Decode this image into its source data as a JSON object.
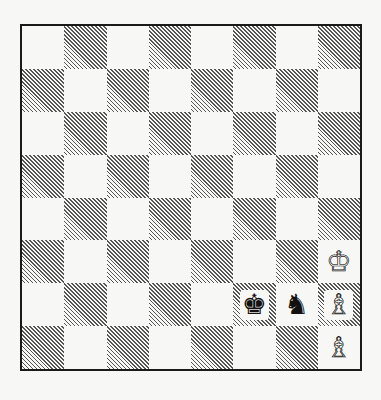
{
  "diagram": {
    "type": "chess-position",
    "orientation": "white-bottom",
    "files": [
      "a",
      "b",
      "c",
      "d",
      "e",
      "f",
      "g",
      "h"
    ],
    "ranks": [
      8,
      7,
      6,
      5,
      4,
      3,
      2,
      1
    ],
    "top_left_square_color": "light",
    "pieces": [
      {
        "square": "h3",
        "color": "white",
        "type": "king",
        "glyph": "♔"
      },
      {
        "square": "h2",
        "color": "white",
        "type": "bishop",
        "glyph": "♗"
      },
      {
        "square": "h1",
        "color": "white",
        "type": "bishop",
        "glyph": "♗"
      },
      {
        "square": "f2",
        "color": "black",
        "type": "king",
        "glyph": "♚"
      },
      {
        "square": "g2",
        "color": "black",
        "type": "knight",
        "glyph": "♞"
      }
    ],
    "colors": {
      "border": "#1a1a1a",
      "light": "#f7f7f5",
      "hatch": "#555555"
    }
  }
}
